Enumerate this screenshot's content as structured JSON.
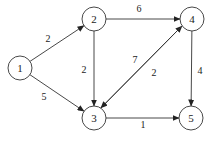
{
  "diagram": {
    "type": "directed-weighted-graph",
    "nodes": [
      {
        "id": "1",
        "label": "1",
        "x": 20,
        "y": 68
      },
      {
        "id": "2",
        "label": "2",
        "x": 94,
        "y": 19
      },
      {
        "id": "3",
        "label": "3",
        "x": 94,
        "y": 118
      },
      {
        "id": "4",
        "label": "4",
        "x": 192,
        "y": 19
      },
      {
        "id": "5",
        "label": "5",
        "x": 191,
        "y": 118
      }
    ],
    "edges": [
      {
        "from": "1",
        "to": "2",
        "weight": "2",
        "lx": 48,
        "ly": 42
      },
      {
        "from": "1",
        "to": "3",
        "weight": "5",
        "lx": 44,
        "ly": 100
      },
      {
        "from": "2",
        "to": "3",
        "weight": "2",
        "lx": 84,
        "ly": 73
      },
      {
        "from": "2",
        "to": "4",
        "weight": "6",
        "lx": 139,
        "ly": 12
      },
      {
        "from": "3",
        "to": "4",
        "weight": "7",
        "lx": 135,
        "ly": 63
      },
      {
        "from": "4",
        "to": "3",
        "weight": "2",
        "lx": 154,
        "ly": 76
      },
      {
        "from": "4",
        "to": "5",
        "weight": "4",
        "lx": 200,
        "ly": 74
      },
      {
        "from": "3",
        "to": "5",
        "weight": "1",
        "lx": 143,
        "ly": 128
      }
    ]
  }
}
